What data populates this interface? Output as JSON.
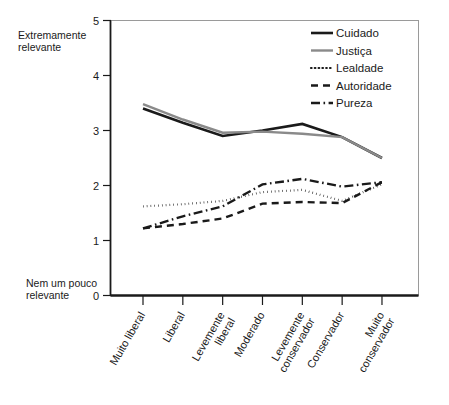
{
  "chart_data": {
    "type": "line",
    "title": "",
    "xlabel": "",
    "ylabel": "",
    "ylim": [
      0,
      5
    ],
    "yticks": [
      0,
      1,
      2,
      3,
      4,
      5
    ],
    "ytick_labels": [
      "0",
      "1",
      "2",
      "3",
      "4",
      "5"
    ],
    "grid": false,
    "legend_position": "top-right",
    "y_axis_low_caption": "Nem um pouco\nrelevante",
    "y_axis_low_caption_line1": "Nem um pouco",
    "y_axis_low_caption_line2": "relevante",
    "y_axis_high_caption_line1": "Extremamente",
    "y_axis_high_caption_line2": "relevante",
    "categories": [
      "Muito liberal",
      "Liberal",
      "Levemente liberal",
      "Moderado",
      "Levemente conservador",
      "Conservador",
      "Muito conservador"
    ],
    "category_lines": [
      [
        "Muito liberal"
      ],
      [
        "Liberal"
      ],
      [
        "Levemente",
        "liberal"
      ],
      [
        "Moderado"
      ],
      [
        "Levemente",
        "conservador"
      ],
      [
        "Conservador"
      ],
      [
        "Muito",
        "conservador"
      ]
    ],
    "series": [
      {
        "name": "Cuidado",
        "color": "#1a1a1a",
        "dash": "none",
        "width": 2.6,
        "values": [
          3.4,
          3.14,
          2.9,
          3.0,
          3.12,
          2.88,
          2.5
        ]
      },
      {
        "name": "Justiça",
        "color": "#8a8a8a",
        "dash": "none",
        "width": 2.4,
        "values": [
          3.48,
          3.2,
          2.96,
          2.98,
          2.94,
          2.88,
          2.5
        ]
      },
      {
        "name": "Lealdade",
        "color": "#1a1a1a",
        "dash": "dotted",
        "width": 2.2,
        "values": [
          1.62,
          1.66,
          1.72,
          1.88,
          1.92,
          1.72,
          2.02
        ]
      },
      {
        "name": "Autoridade",
        "color": "#1a1a1a",
        "dash": "dashed",
        "width": 2.4,
        "values": [
          1.22,
          1.3,
          1.4,
          1.67,
          1.7,
          1.68,
          2.06
        ]
      },
      {
        "name": "Pureza",
        "color": "#1a1a1a",
        "dash": "dashdot",
        "width": 2.4,
        "values": [
          1.22,
          1.44,
          1.62,
          2.02,
          2.12,
          1.98,
          2.06
        ]
      }
    ]
  },
  "legend": {
    "items": [
      {
        "label": "Cuidado"
      },
      {
        "label": "Justiça"
      },
      {
        "label": "Lealdade"
      },
      {
        "label": "Autoridade"
      },
      {
        "label": "Pureza"
      }
    ]
  }
}
